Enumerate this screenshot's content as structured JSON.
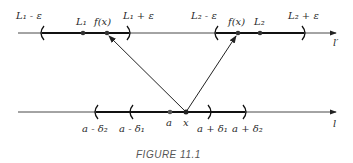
{
  "figure": {
    "caption": "FIGURE 11.1",
    "top_line": {
      "name": "l'",
      "label": "l′",
      "intervals": [
        {
          "left_label": "L₁ - ε",
          "right_label": "L₁ + ε",
          "center_label": "L₁",
          "point_label": "f(x)"
        },
        {
          "left_label": "L₂ - ε",
          "right_label": "L₂ + ε",
          "center_label": "L₂",
          "point_label": "f(x)"
        }
      ]
    },
    "bottom_line": {
      "name": "l",
      "label": "l",
      "outer_left": "a - δ₂",
      "inner_left": "a - δ₁",
      "center_label": "a",
      "point_label": "x",
      "inner_right": "a + δ₁",
      "outer_right": "a + δ₂"
    }
  }
}
